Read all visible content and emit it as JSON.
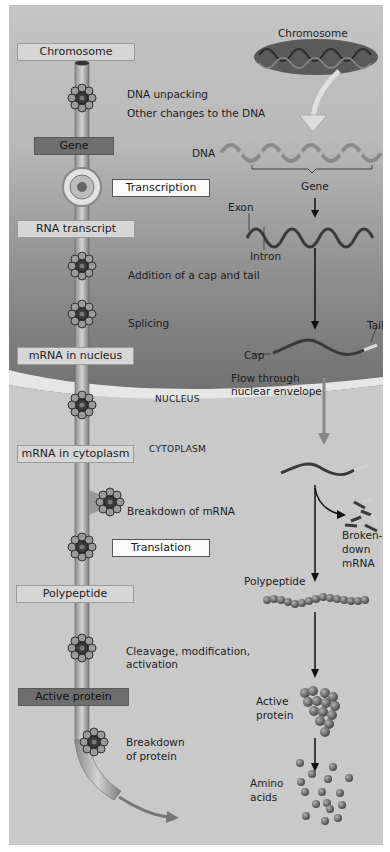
{
  "diagram": {
    "left_column": {
      "boxes": [
        {
          "id": "chromosome",
          "label": "Chromosome",
          "style": "light"
        },
        {
          "id": "gene",
          "label": "Gene",
          "style": "dark"
        },
        {
          "id": "rna-transcript",
          "label": "RNA transcript",
          "style": "light"
        },
        {
          "id": "mrna-nucleus",
          "label": "mRNA in nucleus",
          "style": "light"
        },
        {
          "id": "mrna-cytoplasm",
          "label": "mRNA in cytoplasm",
          "style": "light"
        },
        {
          "id": "polypeptide",
          "label": "Polypeptide",
          "style": "light"
        },
        {
          "id": "active-protein",
          "label": "Active protein",
          "style": "dark"
        }
      ],
      "process_boxes": [
        {
          "id": "transcription",
          "label": "Transcription"
        },
        {
          "id": "translation",
          "label": "Translation"
        }
      ],
      "steps": [
        "DNA unpacking",
        "Other changes to the DNA",
        "Addition of a cap and tail",
        "Splicing",
        "Breakdown of mRNA",
        "Cleavage, modification,",
        "activation",
        "Breakdown",
        "of protein"
      ],
      "regions": {
        "nucleus": "NUCLEUS",
        "cytoplasm": "CYTOPLASM"
      }
    },
    "right_column": {
      "labels": {
        "chromosome": "Chromosome",
        "dna": "DNA",
        "gene": "Gene",
        "exon": "Exon",
        "intron": "Intron",
        "cap": "Cap",
        "tail": "Tail",
        "flow_1": "Flow through",
        "flow_2": "nuclear envelope",
        "broken_1": "Broken-",
        "broken_2": "down",
        "broken_3": "mRNA",
        "polypeptide": "Polypeptide",
        "active_1": "Active",
        "active_2": "protein",
        "amino_1": "Amino",
        "amino_2": "acids"
      }
    },
    "colors": {
      "nucleus_top": "#c4c4c4",
      "nucleus_bottom": "#707070",
      "cytoplasm": "#c9c9c9",
      "envelope": "#e6e6e6",
      "box_light": "#d6d6d6",
      "box_dark": "#6e6e6e",
      "arrow": "#111111"
    }
  }
}
